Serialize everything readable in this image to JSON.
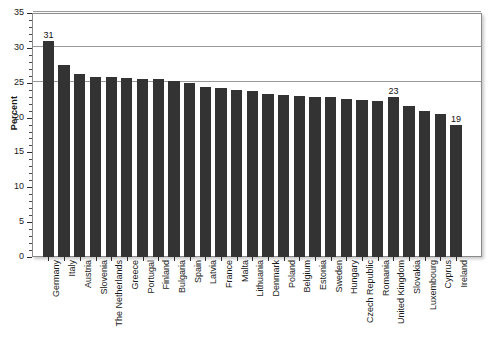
{
  "chart_data": {
    "type": "bar",
    "title": "",
    "xlabel": "",
    "ylabel": "Percent",
    "ylim": [
      0,
      35
    ],
    "ytick_step": 5,
    "yticks": [
      0,
      5,
      10,
      15,
      20,
      25,
      30,
      35
    ],
    "ytick_labels": [
      "0",
      "5",
      "10",
      "15",
      "20",
      "25",
      "30",
      "35"
    ],
    "grid": "horizontal",
    "gridlines_visible": [
      25,
      30,
      35
    ],
    "legend": "none",
    "bar_color": "#333333",
    "categories": [
      "Germany",
      "Italy",
      "Austria",
      "Slovenia",
      "The Netherlands",
      "Greece",
      "Portugal",
      "Finland",
      "Bulgaria",
      "Spain",
      "Latvia",
      "France",
      "Malta",
      "Lithuania",
      "Denmark",
      "Poland",
      "Belgium",
      "Estonia",
      "Sweden",
      "Hungary",
      "Czech Republic",
      "Romania",
      "United Kingdom",
      "Slovakia",
      "Luxembourg",
      "Cyprus",
      "Ireland"
    ],
    "values": [
      31.0,
      27.6,
      26.3,
      25.8,
      25.8,
      25.7,
      25.5,
      25.5,
      25.3,
      25.0,
      24.4,
      24.2,
      24.0,
      23.8,
      23.4,
      23.2,
      23.1,
      23.0,
      22.9,
      22.6,
      22.5,
      22.4,
      23.0,
      21.7,
      20.9,
      20.5,
      19.0
    ],
    "data_labels": [
      {
        "category": "Germany",
        "value": "31"
      },
      {
        "category": "United Kingdom",
        "value": "23"
      },
      {
        "category": "Ireland",
        "value": "19"
      }
    ]
  }
}
